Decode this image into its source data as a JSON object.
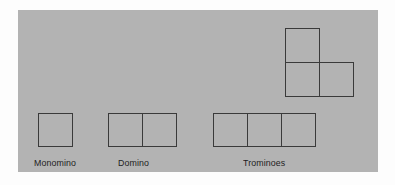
{
  "figure": {
    "title": "",
    "background_color": "#ffffff",
    "panel_color": "#b3b3b3",
    "stroke_color": "#3a3a3a",
    "text_color": "#1d1d1d"
  },
  "labels": {
    "monomino": "Monomino",
    "domino": "Domino",
    "trominoes": "Trominoes"
  },
  "shapes": [
    {
      "id": "monomino",
      "name": "Monomino",
      "cell_count": 1,
      "cells": [
        [
          0,
          0
        ]
      ]
    },
    {
      "id": "domino",
      "name": "Domino",
      "cell_count": 2,
      "cells": [
        [
          0,
          0
        ],
        [
          1,
          0
        ]
      ]
    },
    {
      "id": "tromino-straight",
      "name": "Straight Tromino",
      "cell_count": 3,
      "cells": [
        [
          0,
          0
        ],
        [
          1,
          0
        ],
        [
          2,
          0
        ]
      ]
    },
    {
      "id": "tromino-l",
      "name": "L Tromino",
      "cell_count": 3,
      "cells": [
        [
          0,
          0
        ],
        [
          0,
          1
        ],
        [
          1,
          1
        ]
      ]
    }
  ]
}
